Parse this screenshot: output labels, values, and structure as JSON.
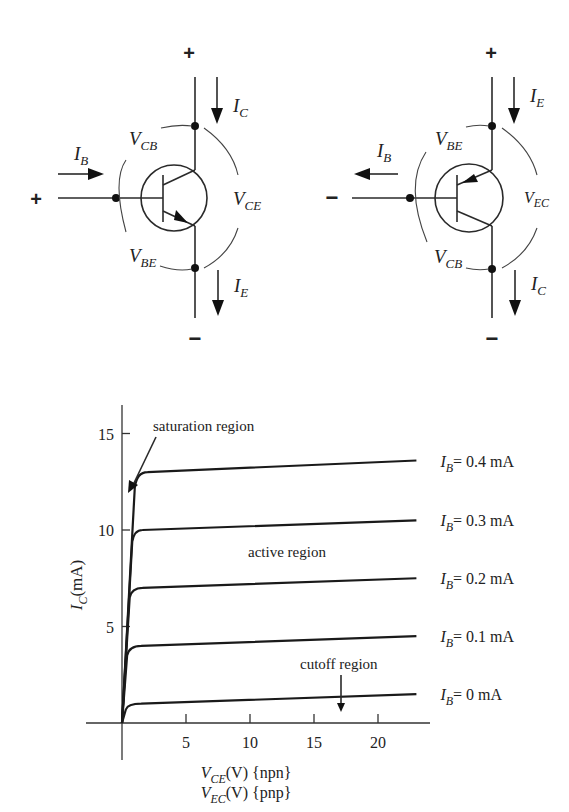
{
  "npn_diagram": {
    "top_sign": "+",
    "bottom_sign": "−",
    "base_sign": "+",
    "labels": {
      "IC": {
        "main": "I",
        "sub": "C"
      },
      "IE": {
        "main": "I",
        "sub": "E"
      },
      "IB": {
        "main": "I",
        "sub": "B"
      },
      "VCB": {
        "main": "V",
        "sub": "CB"
      },
      "VBE": {
        "main": "V",
        "sub": "BE"
      },
      "VCE": {
        "main": "V",
        "sub": "CE"
      }
    }
  },
  "pnp_diagram": {
    "top_sign": "+",
    "bottom_sign": "−",
    "base_sign": "−",
    "labels": {
      "IE": {
        "main": "I",
        "sub": "E"
      },
      "IC": {
        "main": "I",
        "sub": "C"
      },
      "IB": {
        "main": "I",
        "sub": "B"
      },
      "VBE": {
        "main": "V",
        "sub": "BE"
      },
      "VCB": {
        "main": "V",
        "sub": "CB"
      },
      "VEC": {
        "main": "V",
        "sub": "EC"
      }
    }
  },
  "chart_data": {
    "type": "line",
    "title": "",
    "xlabel": "V_CE(V) {npn} / V_EC(V) {pnp}",
    "xlabel_lines": [
      {
        "main": "V",
        "sub": "CE",
        "rest": "(V) {npn}"
      },
      {
        "main": "V",
        "sub": "EC",
        "rest": "(V) {pnp}"
      }
    ],
    "ylabel": "I_C(mA)",
    "ylabel_parts": {
      "main": "I",
      "sub": "C",
      "rest": "(mA)"
    },
    "xlim": [
      0,
      24
    ],
    "ylim": [
      0,
      16
    ],
    "x_ticks": [
      5,
      10,
      15,
      20
    ],
    "y_ticks": [
      5,
      10,
      15
    ],
    "grid": false,
    "legend_position": "right, inline labels",
    "series": [
      {
        "name": "I_B = 0.4 mA",
        "label_main": "I",
        "label_sub": "B",
        "label_rest": "= 0.4 mA",
        "x": [
          0,
          1.0,
          2.0,
          23
        ],
        "values": [
          0,
          12.2,
          13.0,
          13.6
        ]
      },
      {
        "name": "I_B = 0.3 mA",
        "label_main": "I",
        "label_sub": "B",
        "label_rest": "= 0.3 mA",
        "x": [
          0,
          0.8,
          1.6,
          23
        ],
        "values": [
          0,
          9.4,
          10.0,
          10.5
        ]
      },
      {
        "name": "I_B = 0.2 mA",
        "label_main": "I",
        "label_sub": "B",
        "label_rest": "= 0.2 mA",
        "x": [
          0,
          0.6,
          1.6,
          23
        ],
        "values": [
          0,
          6.5,
          7.0,
          7.5
        ]
      },
      {
        "name": "I_B = 0.1 mA",
        "label_main": "I",
        "label_sub": "B",
        "label_rest": "= 0.1 mA",
        "x": [
          0,
          0.4,
          1.5,
          23
        ],
        "values": [
          0,
          3.5,
          4.0,
          4.5
        ]
      },
      {
        "name": "I_B = 0 mA",
        "label_main": "I",
        "label_sub": "B",
        "label_rest": "= 0 mA",
        "x": [
          0,
          0.3,
          1.5,
          23
        ],
        "values": [
          0,
          0.7,
          1.0,
          1.5
        ]
      }
    ],
    "annotations": [
      {
        "text": "saturation region",
        "arrow_to": [
          0.1,
          12.3
        ]
      },
      {
        "text": "active region",
        "at": [
          12,
          8.5
        ]
      },
      {
        "text": "cutoff region",
        "arrow_to": [
          17,
          0.5
        ]
      }
    ]
  }
}
